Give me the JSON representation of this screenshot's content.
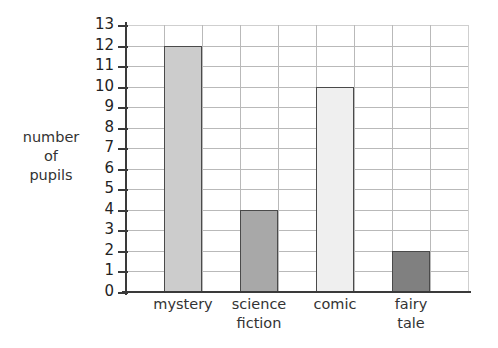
{
  "chart_data": {
    "type": "bar",
    "title": "",
    "subtitle": "",
    "xlabel": "",
    "ylabel": "number of pupils",
    "ylabel_lines": [
      "number",
      "of",
      "pupils"
    ],
    "categories": [
      "mystery",
      "science fiction",
      "comic",
      "fairy tale"
    ],
    "category_label_lines": [
      [
        "mystery"
      ],
      [
        "science",
        "fiction"
      ],
      [
        "comic"
      ],
      [
        "fairy",
        "tale"
      ]
    ],
    "values": [
      12,
      4,
      10,
      2
    ],
    "ylim": [
      0,
      13
    ],
    "ytick_labels": [
      "0",
      "1",
      "2",
      "3",
      "4",
      "5",
      "6",
      "7",
      "8",
      "9",
      "10",
      "11",
      "12",
      "13"
    ],
    "ytick_values": [
      0,
      1,
      2,
      3,
      4,
      5,
      6,
      7,
      8,
      9,
      10,
      11,
      12,
      13
    ],
    "ystep": 1,
    "grid": "both",
    "legend": "none",
    "columns_total": 9,
    "bar_columns": [
      1,
      3,
      5,
      7
    ],
    "bar_colors": [
      "#cccccc",
      "#a8a8a8",
      "#efefef",
      "#808080"
    ],
    "bar_edge_color": "#4a4a4a",
    "grid_color": "#b9b9b9",
    "axis_color": "#3a3a3a",
    "background_color": "#ffffff",
    "annotations": []
  }
}
